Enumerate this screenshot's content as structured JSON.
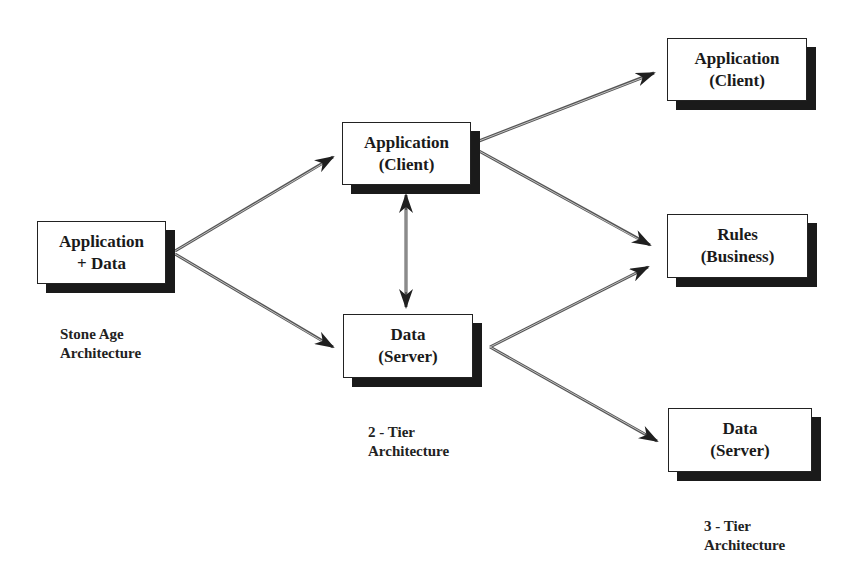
{
  "diagram": {
    "type": "architecture-evolution",
    "colors": {
      "background": "#ffffff",
      "box_border": "#222222",
      "shadow": "#1a1a1a",
      "arrow": "#555555"
    },
    "stages": [
      {
        "caption": {
          "line1": "Stone Age",
          "line2": "Architecture"
        },
        "boxes": [
          {
            "id": "b1",
            "line1": "Application",
            "line2": "+ Data"
          }
        ]
      },
      {
        "caption": {
          "line1": "2 - Tier",
          "line2": "Architecture"
        },
        "boxes": [
          {
            "id": "b2",
            "line1": "Application",
            "line2": "(Client)"
          },
          {
            "id": "b3",
            "line1": "Data",
            "line2": "(Server)"
          }
        ]
      },
      {
        "caption": {
          "line1": "3 - Tier",
          "line2": "Architecture"
        },
        "boxes": [
          {
            "id": "b4",
            "line1": "Application",
            "line2": "(Client)"
          },
          {
            "id": "b5",
            "line1": "Rules",
            "line2": "(Business)"
          },
          {
            "id": "b6",
            "line1": "Data",
            "line2": "(Server)"
          }
        ]
      }
    ],
    "edges": [
      {
        "from": "b1",
        "to": "b2",
        "style": "single"
      },
      {
        "from": "b1",
        "to": "b3",
        "style": "single"
      },
      {
        "from": "b2",
        "to": "b3",
        "style": "double"
      },
      {
        "from": "b2",
        "to": "b4",
        "style": "single"
      },
      {
        "from": "b2",
        "to": "b5",
        "style": "single"
      },
      {
        "from": "b3",
        "to": "b5",
        "style": "single"
      },
      {
        "from": "b3",
        "to": "b6",
        "style": "single"
      }
    ]
  }
}
